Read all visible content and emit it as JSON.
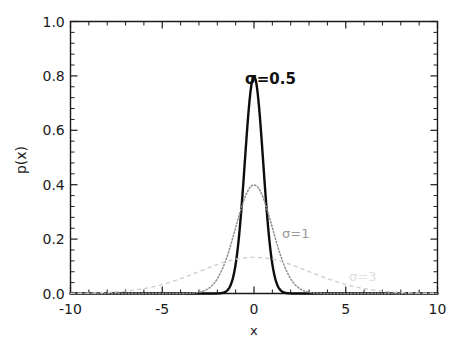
{
  "figure": {
    "background": "#ffffff",
    "frame_color": "#1a1a1a"
  },
  "axes": {
    "xlabel": "x",
    "ylabel": "p(x)",
    "x_ticklabels": [
      "-10",
      "-5",
      "0",
      "5",
      "10"
    ],
    "y_ticklabels": [
      "0.0",
      "0.2",
      "0.4",
      "0.6",
      "0.8",
      "1.0"
    ]
  },
  "annotations": [
    {
      "text": "σ=0.5",
      "color": "#101010",
      "x": 0.35,
      "y": 0.85
    },
    {
      "text": "σ=1",
      "color": "#9a9a9a",
      "x": 1.6,
      "y": 0.235
    },
    {
      "text": "σ=3",
      "color": "#e0e0e0",
      "x": 5.3,
      "y": 0.085
    }
  ],
  "chart_data": {
    "type": "line",
    "title": "",
    "subtitle": "",
    "xlabel": "x",
    "ylabel": "p(x)",
    "xlim": [
      -10,
      10
    ],
    "ylim": [
      0.0,
      1.0
    ],
    "xticks": [
      -10,
      -5,
      0,
      5,
      10
    ],
    "yticks": [
      0.0,
      0.2,
      0.4,
      0.6,
      0.8,
      1.0
    ],
    "x_minor_tick_count": 4,
    "y_minor_tick_count": 4,
    "grid": false,
    "legend_position": "inline-annotations",
    "frame": "box",
    "tick_direction": "in",
    "series": [
      {
        "name": "σ=0.5",
        "sigma": 0.5,
        "mu": 0,
        "peak_value": 0.798,
        "style": "solid",
        "color": "#0d0d0d",
        "linewidth": 2.4,
        "x": [
          -10,
          -9,
          -8,
          -7,
          -6,
          -5,
          -4,
          -3,
          -2.5,
          -2,
          -1.75,
          -1.5,
          -1.25,
          -1,
          -0.875,
          -0.75,
          -0.625,
          -0.5,
          -0.375,
          -0.25,
          -0.125,
          0,
          0.125,
          0.25,
          0.375,
          0.5,
          0.625,
          0.75,
          0.875,
          1,
          1.25,
          1.5,
          1.75,
          2,
          2.5,
          3,
          4,
          5,
          6,
          7,
          8,
          9,
          10
        ],
        "y": [
          0.0,
          0.0,
          0.0,
          0.0,
          0.0,
          0.0,
          0.0,
          0.0,
          0.0001,
          0.0003,
          0.0022,
          0.0089,
          0.029,
          0.108,
          0.176,
          0.2661,
          0.3752,
          0.4839,
          0.5879,
          0.7041,
          0.7731,
          0.7979,
          0.7731,
          0.7041,
          0.5879,
          0.4839,
          0.3752,
          0.2661,
          0.176,
          0.108,
          0.029,
          0.0089,
          0.0022,
          0.0003,
          0.0001,
          0.0,
          0.0,
          0.0,
          0.0,
          0.0,
          0.0,
          0.0,
          0.0
        ]
      },
      {
        "name": "σ=1",
        "sigma": 1,
        "mu": 0,
        "peak_value": 0.399,
        "style": "dotted",
        "color": "#8c8c8c",
        "linewidth": 1.5,
        "x": [
          -10,
          -9,
          -8,
          -7,
          -6,
          -5,
          -4.5,
          -4,
          -3.5,
          -3,
          -2.5,
          -2,
          -1.75,
          -1.5,
          -1.25,
          -1,
          -0.75,
          -0.5,
          -0.25,
          0,
          0.25,
          0.5,
          0.75,
          1,
          1.25,
          1.5,
          1.75,
          2,
          2.5,
          3,
          3.5,
          4,
          4.5,
          5,
          6,
          7,
          8,
          9,
          10
        ],
        "y": [
          0.0,
          0.0,
          0.0,
          0.0,
          0.0,
          1.5e-06,
          1.6e-05,
          0.0001338,
          0.0008727,
          0.0044318,
          0.0175283,
          0.053991,
          0.0862773,
          0.1295176,
          0.1826491,
          0.2419707,
          0.3011374,
          0.3520653,
          0.3866681,
          0.3989423,
          0.3866681,
          0.3520653,
          0.3011374,
          0.2419707,
          0.1826491,
          0.1295176,
          0.0862773,
          0.053991,
          0.0175283,
          0.0044318,
          0.0008727,
          0.0001338,
          1.6e-05,
          1.5e-06,
          0.0,
          0.0,
          0.0,
          0.0,
          0.0
        ]
      },
      {
        "name": "σ=3",
        "sigma": 3,
        "mu": 0,
        "peak_value": 0.133,
        "style": "dashed",
        "color": "#cfcfcf",
        "linewidth": 1.4,
        "x": [
          -10,
          -9.5,
          -9,
          -8.5,
          -8,
          -7.5,
          -7,
          -6.5,
          -6,
          -5.5,
          -5,
          -4.5,
          -4,
          -3.5,
          -3,
          -2.5,
          -2,
          -1.5,
          -1,
          -0.5,
          0,
          0.5,
          1,
          1.5,
          2,
          2.5,
          3,
          3.5,
          4,
          4.5,
          5,
          5.5,
          6,
          6.5,
          7,
          7.5,
          8,
          8.5,
          9,
          9.5,
          10
        ],
        "y": [
          0.000514,
          0.000829,
          0.001307,
          0.002015,
          0.003038,
          0.00448,
          0.006463,
          0.009118,
          0.012577,
          0.016963,
          0.022367,
          0.028834,
          0.036327,
          0.044727,
          0.05384,
          0.063416,
          0.073153,
          0.082723,
          0.091796,
          0.100064,
          0.1329808,
          0.100064,
          0.091796,
          0.082723,
          0.073153,
          0.063416,
          0.05384,
          0.044727,
          0.036327,
          0.028834,
          0.022367,
          0.016963,
          0.012577,
          0.009118,
          0.006463,
          0.00448,
          0.003038,
          0.002015,
          0.001307,
          0.000829,
          0.000514
        ]
      }
    ]
  }
}
